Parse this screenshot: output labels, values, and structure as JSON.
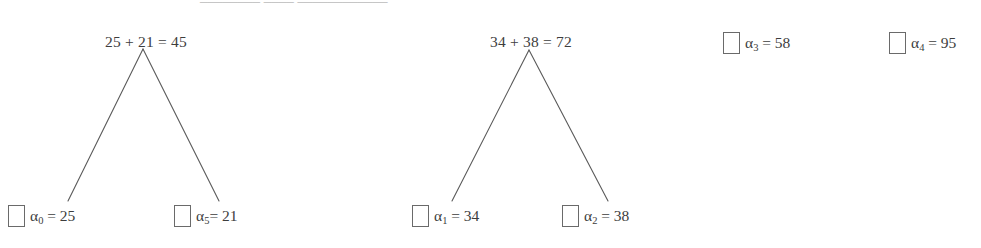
{
  "figure": {
    "background_color": "#ffffff",
    "line_color": "#5a5a5a",
    "text_color": "#3d3d3d",
    "box_border_color": "#6a6a6a",
    "clipped_top_text": "________   ____   ____________",
    "trees": [
      {
        "id": "tree-1",
        "root": {
          "label": "25 + 21 = 45",
          "x": 146,
          "y": 34
        },
        "apex": {
          "x": 143,
          "y": 49
        },
        "leaves": [
          {
            "id": "leaf-a0",
            "symbol": "α",
            "subscript": "0",
            "separator": " = ",
            "value": "25",
            "box_x": 8,
            "box_y": 205,
            "line_end_x": 68,
            "line_end_y": 201
          },
          {
            "id": "leaf-a5",
            "symbol": "α",
            "subscript": "5",
            "separator": "= ",
            "value": "21",
            "box_x": 174,
            "box_y": 205,
            "line_end_x": 219,
            "line_end_y": 201
          }
        ]
      },
      {
        "id": "tree-2",
        "root": {
          "label": "34 + 38 = 72",
          "x": 531,
          "y": 34
        },
        "apex": {
          "x": 529,
          "y": 50
        },
        "leaves": [
          {
            "id": "leaf-a1",
            "symbol": "α",
            "subscript": "1",
            "separator": " = ",
            "value": "34",
            "box_x": 412,
            "box_y": 205,
            "line_end_x": 452,
            "line_end_y": 201
          },
          {
            "id": "leaf-a2",
            "symbol": "α",
            "subscript": "2",
            "separator": " = ",
            "value": "38",
            "box_x": 562,
            "box_y": 205,
            "line_end_x": 608,
            "line_end_y": 201
          }
        ]
      }
    ],
    "standalone_nodes": [
      {
        "id": "node-a3",
        "symbol": "α",
        "subscript": "3",
        "separator": " = ",
        "value": "58",
        "box_x": 723,
        "box_y": 32
      },
      {
        "id": "node-a4",
        "symbol": "α",
        "subscript": "4",
        "separator": " = ",
        "value": "95",
        "box_x": 889,
        "box_y": 32
      }
    ]
  }
}
